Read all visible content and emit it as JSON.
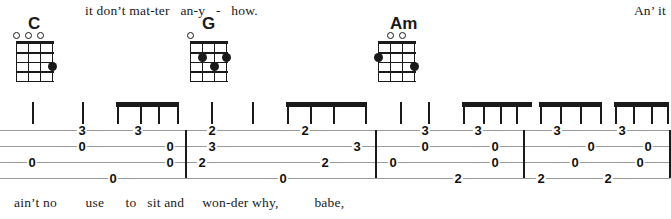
{
  "sheet": {
    "type": "guitar-tablature",
    "instrument": "ukulele",
    "strings": 4,
    "lyrics_top": "it don’t mat-ter   an-y   -   how.",
    "lyrics_top_right": "An’ it",
    "lyrics_bottom": "ain’t no        use      to   sit and     won-der why,          babe,",
    "chords": [
      {
        "name": "C",
        "x": 16,
        "frets": 4,
        "open_strings": [
          1,
          2,
          3
        ],
        "muted_strings": [],
        "dots": [
          {
            "string": 4,
            "fret": 3
          }
        ]
      },
      {
        "name": "G",
        "x": 190,
        "frets": 4,
        "open_strings": [
          1
        ],
        "muted_strings": [],
        "dots": [
          {
            "string": 2,
            "fret": 2
          },
          {
            "string": 4,
            "fret": 2
          },
          {
            "string": 3,
            "fret": 3
          }
        ]
      },
      {
        "name": "Am",
        "x": 378,
        "frets": 4,
        "open_strings": [
          2,
          3
        ],
        "muted_strings": [],
        "dots": [
          {
            "string": 1,
            "fret": 2
          },
          {
            "string": 4,
            "fret": 3
          }
        ]
      }
    ],
    "barlines": [
      185,
      375,
      523,
      669
    ],
    "measures": [
      {
        "index": 1,
        "chord": "C"
      },
      {
        "index": 2,
        "chord": "G"
      },
      {
        "index": 3,
        "chord": "Am"
      },
      {
        "index": 4,
        "chord": "Am"
      }
    ],
    "tab_notes": [
      {
        "x": 32,
        "string": 3,
        "fret": "0"
      },
      {
        "x": 82,
        "string": 1,
        "fret": "3"
      },
      {
        "x": 82,
        "string": 2,
        "fret": "0"
      },
      {
        "x": 113,
        "string": 4,
        "fret": "0"
      },
      {
        "x": 138,
        "string": 1,
        "fret": "3"
      },
      {
        "x": 170,
        "string": 2,
        "fret": "0"
      },
      {
        "x": 170,
        "string": 3,
        "fret": "0"
      },
      {
        "x": 212,
        "string": 1,
        "fret": "2"
      },
      {
        "x": 212,
        "string": 2,
        "fret": "3"
      },
      {
        "x": 202,
        "string": 3,
        "fret": "2"
      },
      {
        "x": 283,
        "string": 4,
        "fret": "0"
      },
      {
        "x": 305,
        "string": 1,
        "fret": "2"
      },
      {
        "x": 325,
        "string": 3,
        "fret": "2"
      },
      {
        "x": 357,
        "string": 2,
        "fret": "3"
      },
      {
        "x": 425,
        "string": 1,
        "fret": "3"
      },
      {
        "x": 425,
        "string": 2,
        "fret": "0"
      },
      {
        "x": 393,
        "string": 3,
        "fret": "0"
      },
      {
        "x": 458,
        "string": 4,
        "fret": "2"
      },
      {
        "x": 478,
        "string": 1,
        "fret": "3"
      },
      {
        "x": 495,
        "string": 2,
        "fret": "0"
      },
      {
        "x": 495,
        "string": 3,
        "fret": "0"
      },
      {
        "x": 557,
        "string": 1,
        "fret": "3"
      },
      {
        "x": 541,
        "string": 4,
        "fret": "2"
      },
      {
        "x": 591,
        "string": 2,
        "fret": "0"
      },
      {
        "x": 575,
        "string": 3,
        "fret": "0"
      },
      {
        "x": 608,
        "string": 4,
        "fret": "2"
      },
      {
        "x": 622,
        "string": 1,
        "fret": "3"
      },
      {
        "x": 648,
        "string": 2,
        "fret": "0"
      },
      {
        "x": 640,
        "string": 3,
        "fret": "0"
      }
    ],
    "rhythm": [
      {
        "type": "stem",
        "x": 32
      },
      {
        "type": "stem",
        "x": 82
      },
      {
        "type": "beam",
        "x": 116,
        "width": 62
      },
      {
        "type": "stem",
        "x": 117
      },
      {
        "type": "stem",
        "x": 140
      },
      {
        "type": "stem",
        "x": 158
      },
      {
        "type": "stem",
        "x": 177
      },
      {
        "type": "stem",
        "x": 211
      },
      {
        "type": "stem",
        "x": 252
      },
      {
        "type": "beam",
        "x": 286,
        "width": 80
      },
      {
        "type": "stem",
        "x": 287
      },
      {
        "type": "stem",
        "x": 310
      },
      {
        "type": "stem",
        "x": 333
      },
      {
        "type": "stem",
        "x": 365
      },
      {
        "type": "stem",
        "x": 400
      },
      {
        "type": "stem",
        "x": 428
      },
      {
        "type": "beam",
        "x": 462,
        "width": 70
      },
      {
        "type": "stem",
        "x": 463
      },
      {
        "type": "stem",
        "x": 483
      },
      {
        "type": "stem",
        "x": 500
      },
      {
        "type": "stem",
        "x": 516
      },
      {
        "type": "beam",
        "x": 539,
        "width": 62
      },
      {
        "type": "stem",
        "x": 540
      },
      {
        "type": "stem",
        "x": 560
      },
      {
        "type": "stem",
        "x": 580
      },
      {
        "type": "stem",
        "x": 600
      },
      {
        "type": "beam",
        "x": 614,
        "width": 54
      },
      {
        "type": "stem",
        "x": 615
      },
      {
        "type": "stem",
        "x": 633
      },
      {
        "type": "stem",
        "x": 651
      },
      {
        "type": "stem",
        "x": 667
      }
    ]
  }
}
